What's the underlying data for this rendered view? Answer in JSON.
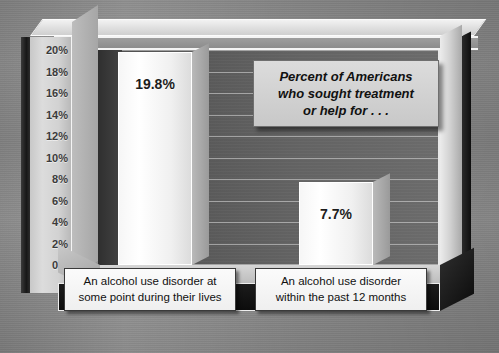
{
  "chart_data": {
    "type": "bar",
    "title": "Percent of Americans who sought treatment or help for . . .",
    "title_lines": [
      "Percent of Americans",
      "who sought treatment",
      "or help for . . ."
    ],
    "xlabel": "",
    "ylabel": "",
    "ylim": [
      0,
      20
    ],
    "grid": true,
    "legend": "none",
    "categories": [
      "An alcohol use disorder at some point during their lives",
      "An alcohol use disorder within the past 12 months"
    ],
    "category_lines": [
      [
        "An alcohol use disorder at",
        "some point during their lives"
      ],
      [
        "An alcohol use disorder",
        "within the past 12 months"
      ]
    ],
    "values": [
      19.8,
      7.7
    ],
    "value_labels": [
      "19.8%",
      "7.7%"
    ],
    "yticks": [
      20,
      18,
      16,
      14,
      12,
      10,
      8,
      6,
      4,
      2,
      0
    ],
    "ytick_labels": [
      "20%",
      "18%",
      "16%",
      "14%",
      "12%",
      "10%",
      "8%",
      "6%",
      "4%",
      "2%",
      "0%"
    ]
  },
  "colors": {
    "bar_face": "#f4f4f4",
    "plot_background": "#5d5d5d",
    "page_background": "#8e8e8e",
    "callout_background": "#d2d2d2",
    "caption_background": "#f7f7f7",
    "text": "#111111"
  }
}
